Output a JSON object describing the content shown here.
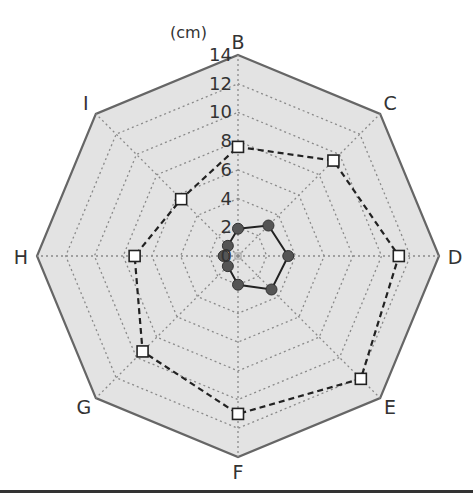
{
  "chart_data": {
    "type": "radar",
    "title": "",
    "unit_label": "(cm)",
    "categories": [
      "B",
      "C",
      "D",
      "E",
      "F",
      "G",
      "H",
      "I"
    ],
    "radial_ticks": [
      "0",
      "2",
      "4",
      "6",
      "8",
      "10",
      "12",
      "14"
    ],
    "rlim": [
      0,
      14
    ],
    "grid": true,
    "series": [
      {
        "name": "outer (dashed, open squares)",
        "line_style": "dashed",
        "marker": "open-square",
        "color": "#222222",
        "values": [
          7.6,
          9.4,
          11.2,
          12.1,
          11.0,
          9.4,
          7.2,
          5.6
        ]
      },
      {
        "name": "inner (solid, filled circles)",
        "line_style": "solid",
        "marker": "filled-circle",
        "color": "#222222",
        "marker_color": "#555555",
        "values": [
          1.9,
          3.0,
          3.5,
          3.3,
          2.0,
          1.0,
          1.0,
          1.0
        ]
      }
    ],
    "colors": {
      "plot_fill": "#e3e3e3",
      "outline": "#666666",
      "grid": "#8a8a8a"
    }
  }
}
